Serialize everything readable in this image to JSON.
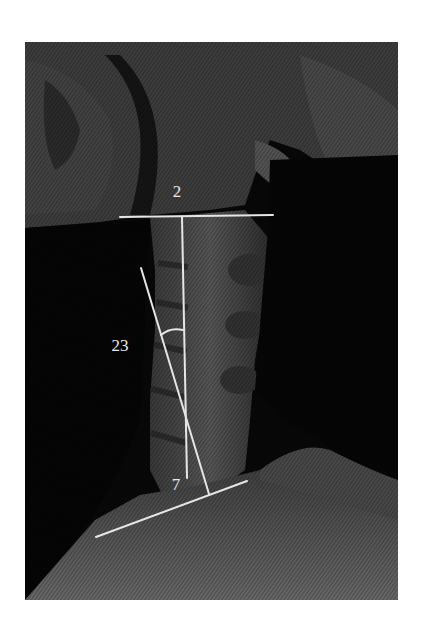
{
  "figure": {
    "type": "lateral cervical spine radiograph",
    "annotations": {
      "top_vertebra_label": "2",
      "bottom_vertebra_label": "7",
      "angle_label": "23"
    },
    "colors": {
      "background": "#ffffff",
      "xray_dark": "#0a0a0a",
      "bone_grey": "#5a5a5a",
      "annotation_line": "#e6e6e6"
    },
    "geometry": {
      "image_bounds": {
        "x": 25,
        "y": 42,
        "width": 373,
        "height": 558
      },
      "c2_line": {
        "x1": 120,
        "y1": 217,
        "x2": 273,
        "y2": 215
      },
      "vertical_line": {
        "x1": 182,
        "y1": 217,
        "x2": 187,
        "y2": 478
      },
      "slanted_line": {
        "x1": 141,
        "y1": 268,
        "x2": 209,
        "y2": 494
      },
      "c7_line": {
        "x1": 96,
        "y1": 537,
        "x2": 247,
        "y2": 481
      }
    }
  }
}
